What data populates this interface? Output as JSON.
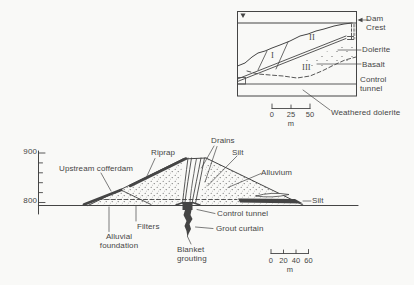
{
  "figure": {
    "background": "#f9f9f7",
    "ink": "#454545"
  },
  "inset": {
    "zone_labels": [
      "I",
      "II",
      "III"
    ],
    "labels": {
      "dam_crest": "Dam\nCrest",
      "dolerite": "Dolerite",
      "basalt": "Basalt",
      "control_tunnel": "Control\ntunnel",
      "weathered_dolerite": "Weathered dolerite"
    },
    "scale": {
      "ticks": [
        "0",
        "25",
        "50"
      ],
      "unit": "m"
    }
  },
  "main": {
    "elevation_ticks": [
      "900",
      "800"
    ],
    "labels": {
      "upstream_cofferdam": "Upstream cofferdam",
      "riprap": "Riprap",
      "drains": "Drains",
      "silt_core": "Silt",
      "alluvium": "Alluvium",
      "silt_toe": "Silt",
      "control_tunnel": "Control tunnel",
      "grout_curtain": "Grout curtain",
      "filters": "Filters",
      "alluvial_foundation": "Alluvial\nfoundation",
      "blanket_grouting": "Blanket\ngrouting"
    },
    "scale": {
      "ticks": [
        "0",
        "20",
        "40",
        "60"
      ],
      "unit": "m"
    }
  }
}
